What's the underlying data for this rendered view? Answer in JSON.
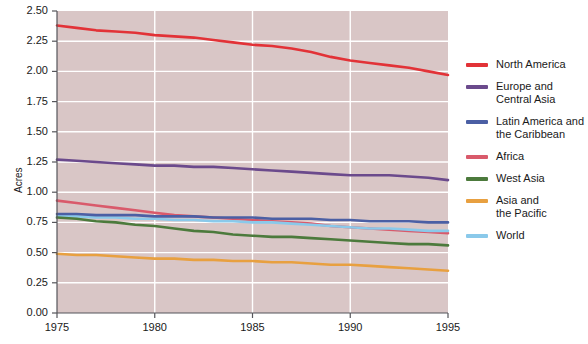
{
  "chart_data": {
    "type": "line",
    "title": "",
    "xlabel": "",
    "ylabel": "Acres",
    "xlim": [
      1975,
      1995
    ],
    "ylim": [
      0.0,
      2.5
    ],
    "xticks": [
      1975,
      1980,
      1985,
      1990,
      1995
    ],
    "yticks": [
      "0.00",
      "0.25",
      "0.50",
      "0.75",
      "1.00",
      "1.25",
      "1.50",
      "1.75",
      "2.00",
      "2.25",
      "2.50"
    ],
    "grid": true,
    "grid_axis": "both",
    "legend_position": "right",
    "plot_background": "#d9c6c6",
    "grid_color": "#ffffff",
    "x": [
      1975,
      1976,
      1977,
      1978,
      1979,
      1980,
      1981,
      1982,
      1983,
      1984,
      1985,
      1986,
      1987,
      1988,
      1989,
      1990,
      1991,
      1992,
      1993,
      1994,
      1995
    ],
    "series": [
      {
        "name": "North America",
        "color": "#e23237",
        "values": [
          2.38,
          2.36,
          2.34,
          2.33,
          2.32,
          2.3,
          2.29,
          2.28,
          2.26,
          2.24,
          2.22,
          2.21,
          2.19,
          2.16,
          2.12,
          2.09,
          2.07,
          2.05,
          2.03,
          2.0,
          1.97
        ]
      },
      {
        "name": "Europe and\nCentral Asia",
        "color": "#6b4a8c",
        "values": [
          1.27,
          1.26,
          1.25,
          1.24,
          1.23,
          1.22,
          1.22,
          1.21,
          1.21,
          1.2,
          1.19,
          1.18,
          1.17,
          1.16,
          1.15,
          1.14,
          1.14,
          1.14,
          1.13,
          1.12,
          1.1
        ]
      },
      {
        "name": "Latin America and\nthe Caribbean",
        "color": "#4b5fa4",
        "values": [
          0.82,
          0.82,
          0.81,
          0.81,
          0.81,
          0.8,
          0.8,
          0.8,
          0.79,
          0.79,
          0.79,
          0.78,
          0.78,
          0.78,
          0.77,
          0.77,
          0.76,
          0.76,
          0.76,
          0.75,
          0.75
        ]
      },
      {
        "name": "Africa",
        "color": "#d95a6b",
        "values": [
          0.93,
          0.91,
          0.89,
          0.87,
          0.85,
          0.83,
          0.81,
          0.8,
          0.79,
          0.78,
          0.77,
          0.76,
          0.75,
          0.74,
          0.72,
          0.71,
          0.7,
          0.69,
          0.68,
          0.67,
          0.66
        ]
      },
      {
        "name": "West Asia",
        "color": "#4c7a3c",
        "values": [
          0.79,
          0.78,
          0.76,
          0.75,
          0.73,
          0.72,
          0.7,
          0.68,
          0.67,
          0.65,
          0.64,
          0.63,
          0.63,
          0.62,
          0.61,
          0.6,
          0.59,
          0.58,
          0.57,
          0.57,
          0.56
        ]
      },
      {
        "name": "Asia and\nthe Pacific",
        "color": "#e8a040",
        "values": [
          0.49,
          0.48,
          0.48,
          0.47,
          0.46,
          0.45,
          0.45,
          0.44,
          0.44,
          0.43,
          0.43,
          0.42,
          0.42,
          0.41,
          0.4,
          0.4,
          0.39,
          0.38,
          0.37,
          0.36,
          0.35
        ]
      },
      {
        "name": "World",
        "color": "#8ac9ea",
        "values": [
          0.8,
          0.8,
          0.79,
          0.79,
          0.78,
          0.78,
          0.77,
          0.77,
          0.76,
          0.76,
          0.75,
          0.75,
          0.74,
          0.73,
          0.72,
          0.71,
          0.7,
          0.7,
          0.69,
          0.68,
          0.68
        ]
      }
    ]
  },
  "legend": {
    "items": [
      {
        "label": "North America",
        "color": "#e23237"
      },
      {
        "label": "Europe and\nCentral Asia",
        "color": "#6b4a8c"
      },
      {
        "label": "Latin America and\nthe Caribbean",
        "color": "#4b5fa4"
      },
      {
        "label": "Africa",
        "color": "#d95a6b"
      },
      {
        "label": "West Asia",
        "color": "#4c7a3c"
      },
      {
        "label": "Asia and\nthe Pacific",
        "color": "#e8a040"
      },
      {
        "label": "World",
        "color": "#8ac9ea"
      }
    ]
  }
}
